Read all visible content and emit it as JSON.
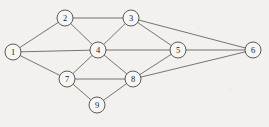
{
  "figure": {
    "kind": "undirected-graph-diagram",
    "background_color": "#f2f1ee",
    "node_fill_color": "#f7f6f3",
    "node_stroke_color": "#3d3d3d",
    "edge_color": "#4a4a4a",
    "label_color": "#222222",
    "node_radius": 8,
    "node_count": 9,
    "edge_count": 17
  },
  "nodes": [
    {
      "id": "1",
      "label": "1",
      "x": 13,
      "y": 52
    },
    {
      "id": "2",
      "label": "2",
      "x": 65,
      "y": 18
    },
    {
      "id": "3",
      "label": "3",
      "x": 131,
      "y": 18
    },
    {
      "id": "4",
      "label": "4",
      "x": 98,
      "y": 50
    },
    {
      "id": "5",
      "label": "5",
      "x": 178,
      "y": 50
    },
    {
      "id": "6",
      "label": "6",
      "x": 253,
      "y": 50
    },
    {
      "id": "7",
      "label": "7",
      "x": 67,
      "y": 79
    },
    {
      "id": "8",
      "label": "8",
      "x": 133,
      "y": 79
    },
    {
      "id": "9",
      "label": "9",
      "x": 97,
      "y": 105
    }
  ],
  "edges": [
    {
      "source": "1",
      "target": "2"
    },
    {
      "source": "1",
      "target": "4"
    },
    {
      "source": "1",
      "target": "7"
    },
    {
      "source": "2",
      "target": "3"
    },
    {
      "source": "2",
      "target": "4"
    },
    {
      "source": "3",
      "target": "4"
    },
    {
      "source": "3",
      "target": "5"
    },
    {
      "source": "3",
      "target": "6"
    },
    {
      "source": "4",
      "target": "5"
    },
    {
      "source": "4",
      "target": "7"
    },
    {
      "source": "4",
      "target": "8"
    },
    {
      "source": "5",
      "target": "6"
    },
    {
      "source": "5",
      "target": "8"
    },
    {
      "source": "7",
      "target": "8"
    },
    {
      "source": "7",
      "target": "9"
    },
    {
      "source": "8",
      "target": "9"
    },
    {
      "source": "8",
      "target": "6"
    }
  ]
}
